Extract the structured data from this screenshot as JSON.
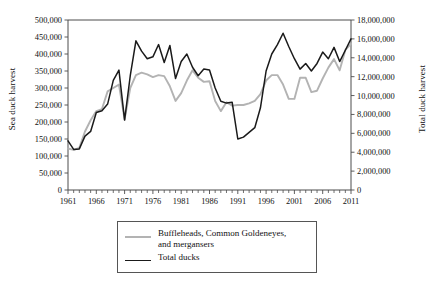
{
  "chart_data": {
    "type": "line",
    "title": "",
    "xlabel": "",
    "ylabel": "Sea duck harvest",
    "ylabel_secondary": "Total duck harvest",
    "grid": false,
    "legend_position": "bottom-center",
    "xlim": [
      1961,
      2011
    ],
    "ylim": [
      0,
      500000
    ],
    "ylim_secondary": [
      0,
      18000000
    ],
    "x_tick_labels": [
      "1961",
      "1966",
      "1971",
      "1976",
      "1981",
      "1986",
      "1991",
      "1996",
      "2001",
      "2006",
      "2011"
    ],
    "x_tick_values": [
      1961,
      1966,
      1971,
      1976,
      1981,
      1986,
      1991,
      1996,
      2001,
      2006,
      2011
    ],
    "x_minor_tick_step": 1,
    "y_tick_labels_left": [
      "0",
      "50,000",
      "100,000",
      "150,000",
      "200,000",
      "250,000",
      "300,000",
      "350,000",
      "400,000",
      "450,000",
      "500,000"
    ],
    "y_tick_values_left": [
      0,
      50000,
      100000,
      150000,
      200000,
      250000,
      300000,
      350000,
      400000,
      450000,
      500000
    ],
    "y_tick_labels_right": [
      "0",
      "2,000,000",
      "4,000,000",
      "6,000,000",
      "8,000,000",
      "10,000,000",
      "12,000,000",
      "14,000,000",
      "16,000,000",
      "18,000,000"
    ],
    "y_tick_values_right": [
      0,
      2000000,
      4000000,
      6000000,
      8000000,
      10000000,
      12000000,
      14000000,
      16000000,
      18000000
    ],
    "x": [
      1961,
      1962,
      1963,
      1964,
      1965,
      1966,
      1967,
      1968,
      1969,
      1970,
      1971,
      1972,
      1973,
      1974,
      1975,
      1976,
      1977,
      1978,
      1979,
      1980,
      1981,
      1982,
      1983,
      1984,
      1985,
      1986,
      1987,
      1988,
      1989,
      1990,
      1991,
      1992,
      1993,
      1994,
      1995,
      1996,
      1997,
      1998,
      1999,
      2000,
      2001,
      2002,
      2003,
      2004,
      2005,
      2006,
      2007,
      2008,
      2009,
      2010,
      2011
    ],
    "series": [
      {
        "name": "Buffleheads, Common Goldeneyes, and mergansers",
        "axis": "left",
        "color": "#b3b3b3",
        "units": "Sea duck harvest",
        "values": [
          122000,
          118000,
          124000,
          172000,
          205000,
          232000,
          238000,
          290000,
          300000,
          310000,
          208000,
          300000,
          338000,
          345000,
          340000,
          332000,
          338000,
          335000,
          305000,
          262000,
          285000,
          322000,
          352000,
          330000,
          318000,
          320000,
          262000,
          232000,
          258000,
          248000,
          250000,
          250000,
          255000,
          262000,
          282000,
          322000,
          338000,
          338000,
          310000,
          268000,
          268000,
          330000,
          330000,
          288000,
          292000,
          328000,
          360000,
          385000,
          352000,
          412000,
          430000
        ]
      },
      {
        "name": "Total ducks",
        "axis": "right",
        "color": "#1a1a1a",
        "units": "Total duck harvest",
        "values": [
          5200000,
          4300000,
          4350000,
          5700000,
          6200000,
          8200000,
          8400000,
          9100000,
          11600000,
          12700000,
          7400000,
          12100000,
          15800000,
          14700000,
          13900000,
          14100000,
          15400000,
          13500000,
          15300000,
          11800000,
          13600000,
          14400000,
          13000000,
          12100000,
          12800000,
          12700000,
          10800000,
          9400000,
          9200000,
          9300000,
          5400000,
          5600000,
          6100000,
          6600000,
          8700000,
          12600000,
          14400000,
          15400000,
          16600000,
          15200000,
          13900000,
          12800000,
          13400000,
          12600000,
          13400000,
          14600000,
          13900000,
          15100000,
          13600000,
          14800000,
          16000000
        ]
      }
    ]
  },
  "legend": {
    "entries": [
      {
        "label": "Buffleheads, Common Goldeneyes,",
        "label2": "and mergansers",
        "color": "#b3b3b3"
      },
      {
        "label": "Total ducks",
        "label2": "",
        "color": "#1a1a1a"
      }
    ]
  }
}
